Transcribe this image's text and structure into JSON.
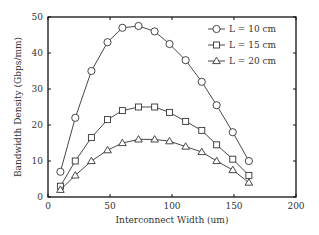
{
  "chart_data": {
    "type": "line",
    "title": "",
    "xlabel": "Interconnect Width (um)",
    "ylabel": "Bandwidth Density (Gbps/mm)",
    "xlim": [
      0,
      200
    ],
    "ylim": [
      0,
      50
    ],
    "xticks": [
      0,
      50,
      100,
      150,
      200
    ],
    "yticks": [
      0,
      10,
      20,
      30,
      40,
      50
    ],
    "grid": false,
    "legend_position": "upper right",
    "x": [
      10,
      22,
      35,
      48,
      60,
      73,
      86,
      98,
      111,
      124,
      136,
      149,
      162
    ],
    "series": [
      {
        "name": "L = 10 cm",
        "marker": "circle",
        "values": [
          7,
          22,
          35,
          43,
          47,
          47.5,
          46,
          42.5,
          38,
          32,
          25.5,
          18,
          10
        ]
      },
      {
        "name": "L = 15 cm",
        "marker": "square",
        "values": [
          3,
          10,
          16.5,
          21.5,
          24,
          25,
          25,
          23.5,
          21,
          18.5,
          14.5,
          10.5,
          6
        ]
      },
      {
        "name": "L = 20 cm",
        "marker": "triangle",
        "values": [
          2,
          6,
          10,
          13,
          15,
          16,
          16,
          15.5,
          14,
          12.5,
          10,
          7.5,
          4
        ]
      }
    ]
  },
  "colors": {
    "line": "#333333",
    "axis": "#111111",
    "background": "#ffffff"
  }
}
